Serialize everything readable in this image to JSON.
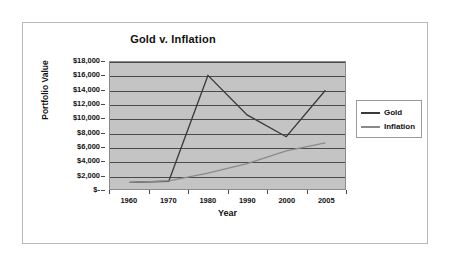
{
  "chart_data": {
    "type": "line",
    "title": "Gold v. Inflation",
    "xlabel": "Year",
    "ylabel": "Portfolio Value",
    "categories": [
      "1960",
      "1970",
      "1980",
      "1990",
      "2000",
      "2005"
    ],
    "x": [
      1960,
      1970,
      1980,
      1990,
      2000,
      2005
    ],
    "ylim": [
      0,
      18000
    ],
    "y_tick_labels": [
      "$-",
      "$2,000",
      "$4,000",
      "$6,000",
      "$8,000",
      "$10,000",
      "$12,000",
      "$14,000",
      "$16,000",
      "$18,000"
    ],
    "y_tick_values": [
      0,
      2000,
      4000,
      6000,
      8000,
      10000,
      12000,
      14000,
      16000,
      18000
    ],
    "grid": "horizontal",
    "legend_position": "right",
    "plot_background": "#c4c4c4",
    "series": [
      {
        "name": "Gold",
        "color": "#3a3a3a",
        "values": [
          950,
          1100,
          16100,
          10500,
          7400,
          14000
        ]
      },
      {
        "name": "Inflation",
        "color": "#8a8a8a",
        "values": [
          950,
          1150,
          2250,
          3600,
          5400,
          6550
        ]
      }
    ]
  },
  "legend": {
    "entries": [
      {
        "label": "Gold",
        "color": "#3a3a3a"
      },
      {
        "label": "Inflation",
        "color": "#8a8a8a"
      }
    ]
  }
}
